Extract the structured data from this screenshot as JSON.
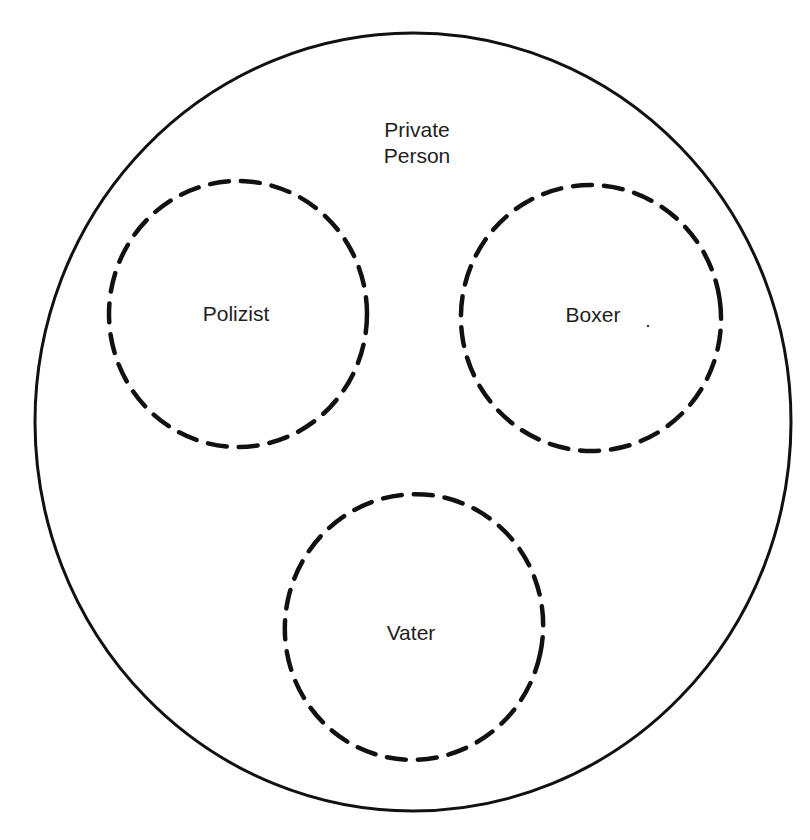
{
  "diagram": {
    "colors": {
      "background": "#ffffff",
      "stroke": "#111111",
      "text": "#1e1e1e"
    },
    "outer": {
      "label_line1": "Private",
      "label_line2": "Person",
      "shape": "ellipse",
      "stroke_style": "solid",
      "cx": 413,
      "cy": 422,
      "rx": 378,
      "ry": 389
    },
    "roles": [
      {
        "label": "Polizist",
        "shape": "circle",
        "stroke_style": "dashed",
        "cx": 238,
        "cy": 314,
        "rx": 129,
        "ry": 133
      },
      {
        "label": "Boxer",
        "shape": "circle",
        "stroke_style": "dashed",
        "cx": 591,
        "cy": 318,
        "rx": 130,
        "ry": 133
      },
      {
        "label": "Vater",
        "shape": "circle",
        "stroke_style": "dashed",
        "cx": 414,
        "cy": 627,
        "rx": 129,
        "ry": 133
      }
    ]
  }
}
